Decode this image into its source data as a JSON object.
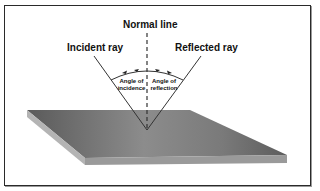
{
  "diagram": {
    "labels": {
      "normal_line": "Normal line",
      "incident_ray": "Incident ray",
      "reflected_ray": "Reflected ray",
      "angle_incidence_line1": "Angle of",
      "angle_incidence_line2": "incidence",
      "angle_reflection_line1": "Angle of",
      "angle_reflection_line2": "reflection"
    },
    "colors": {
      "frame": "#2a2a2a",
      "plate_top_dark": "#5e5e5e",
      "plate_top_light": "#8a8a8a",
      "plate_edge": "#9c9c9c",
      "plate_side": "#b0b0b0",
      "lines": "#333333"
    }
  }
}
